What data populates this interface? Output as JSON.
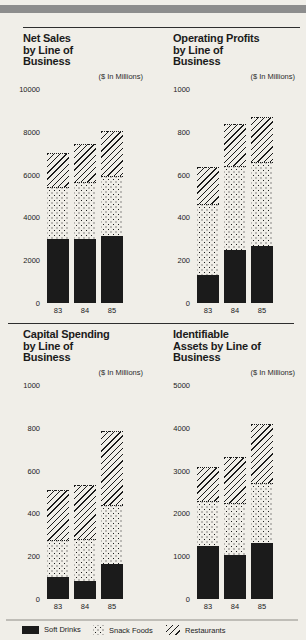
{
  "page": {
    "background": "#f0eee8",
    "ink": "#1b1b1b",
    "top_bar_color": "#8d8d8d"
  },
  "legend": {
    "items": [
      {
        "label": "Soft Drinks",
        "pattern": "solid-black"
      },
      {
        "label": "Snack Foods",
        "pattern": "dots"
      },
      {
        "label": "Restaurants",
        "pattern": "diagonal-hatch"
      }
    ]
  },
  "chart_data": [
    {
      "type": "bar",
      "stacked": true,
      "title_lines": [
        "Net Sales",
        "by Line of",
        "Business"
      ],
      "units_label": "($ In Millions)",
      "categories": [
        "83",
        "84",
        "85"
      ],
      "ylim": [
        0,
        10000
      ],
      "yticks": [
        0,
        2000,
        4000,
        6000,
        8000,
        10000
      ],
      "grid": false,
      "series": [
        {
          "name": "Soft Drinks",
          "values": [
            3000,
            3000,
            3150
          ]
        },
        {
          "name": "Snack Foods",
          "values": [
            2400,
            2650,
            2800
          ]
        },
        {
          "name": "Restaurants",
          "values": [
            1600,
            1800,
            2100
          ]
        }
      ]
    },
    {
      "type": "bar",
      "stacked": true,
      "title_lines": [
        "Operating Profits",
        "by Line of",
        "Business"
      ],
      "units_label": "($ In Millions)",
      "categories": [
        "83",
        "84",
        "85"
      ],
      "ylim": [
        0,
        1000
      ],
      "yticks": [
        0,
        200,
        400,
        600,
        800,
        1000
      ],
      "grid": false,
      "series": [
        {
          "name": "Soft Drinks",
          "values": [
            130,
            250,
            265
          ]
        },
        {
          "name": "Snack Foods",
          "values": [
            335,
            390,
            395
          ]
        },
        {
          "name": "Restaurants",
          "values": [
            170,
            195,
            210
          ]
        }
      ]
    },
    {
      "type": "bar",
      "stacked": true,
      "title_lines": [
        "Capital Spending",
        "by Line of",
        "Business"
      ],
      "units_label": "($ In Millions)",
      "categories": [
        "83",
        "84",
        "85"
      ],
      "ylim": [
        0,
        1000
      ],
      "yticks": [
        0,
        200,
        400,
        600,
        800,
        1000
      ],
      "grid": false,
      "series": [
        {
          "name": "Soft Drinks",
          "values": [
            105,
            85,
            165
          ]
        },
        {
          "name": "Snack Foods",
          "values": [
            170,
            195,
            275
          ]
        },
        {
          "name": "Restaurants",
          "values": [
            235,
            255,
            345
          ]
        }
      ]
    },
    {
      "type": "bar",
      "stacked": true,
      "title_lines": [
        "Identifiable",
        "Assets by Line of",
        "Business"
      ],
      "units_label": "($ In Millions)",
      "categories": [
        "83",
        "84",
        "85"
      ],
      "ylim": [
        0,
        5000
      ],
      "yticks": [
        0,
        1000,
        2000,
        3000,
        4000,
        5000
      ],
      "grid": false,
      "series": [
        {
          "name": "Soft Drinks",
          "values": [
            1250,
            1040,
            1300
          ]
        },
        {
          "name": "Snack Foods",
          "values": [
            1030,
            1210,
            1410
          ]
        },
        {
          "name": "Restaurants",
          "values": [
            810,
            1070,
            1390
          ]
        }
      ]
    }
  ]
}
